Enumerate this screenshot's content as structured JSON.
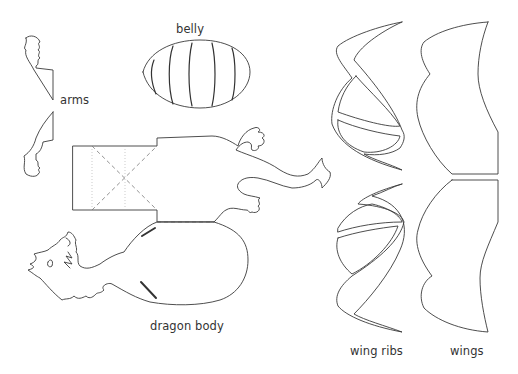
{
  "labels": {
    "belly": "belly",
    "arms": "arms",
    "dragon_body": "dragon body",
    "wing_ribs": "wing ribs",
    "wings": "wings"
  },
  "colors": {
    "background": "#ffffff",
    "line": "#3a3a3a"
  }
}
